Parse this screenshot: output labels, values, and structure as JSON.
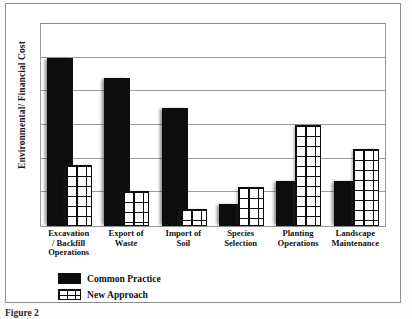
{
  "figure": {
    "caption": "Figure 2",
    "y_axis_title": "Environmental/ Financial Cost"
  },
  "legend": {
    "position": "bottom-left",
    "entries": [
      {
        "label": "Common Practice",
        "swatch": "solid-black-swatch"
      },
      {
        "label": "New Approach",
        "swatch": "grid-hatch-swatch"
      }
    ]
  },
  "chart_data": {
    "type": "bar",
    "title": "",
    "subtitle": "",
    "xlabel": "",
    "ylabel": "Environmental/ Financial Cost",
    "categories": [
      "Excavation / Backfill Operations",
      "Export of Waste",
      "Import of Soil",
      "Species Selection",
      "Planting Operations",
      "Landscape Maintenance"
    ],
    "category_lines": [
      [
        "Excavation",
        "/ Backfill",
        "Operations"
      ],
      [
        "Export of",
        "Waste"
      ],
      [
        "Import of",
        "Soil"
      ],
      [
        "Species",
        "Selection"
      ],
      [
        "Planting",
        "Operations"
      ],
      [
        "Landscape",
        "Maintenance"
      ]
    ],
    "series": [
      {
        "name": "Common Practice",
        "values": [
          5.0,
          4.4,
          3.5,
          0.65,
          1.35,
          1.35
        ]
      },
      {
        "name": "New Approach",
        "values": [
          1.8,
          1.05,
          0.5,
          1.15,
          3.0,
          2.3
        ]
      }
    ],
    "ylim": [
      0,
      6
    ],
    "yticks": [
      0,
      1,
      2,
      3,
      4,
      5,
      6
    ],
    "ytick_labels": [
      "",
      "",
      "",
      "",
      "",
      "",
      ""
    ],
    "grid": true,
    "grid_axis": "y",
    "legend_position": "bottom-left",
    "colors": {
      "common_practice": "#0d0d0d",
      "new_approach_fill": "#ffffff",
      "new_approach_line": "#0d0d0d",
      "gridline": "#9c9c9c",
      "frame": "#8e8e8e",
      "background": "#ffffff"
    }
  }
}
